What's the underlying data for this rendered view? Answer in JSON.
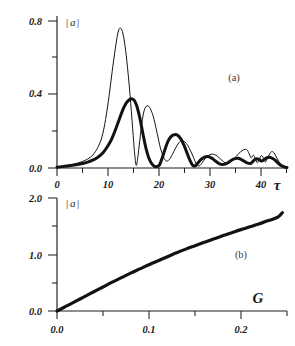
{
  "figure": {
    "background_color": "#ffffff",
    "ink_color": "#151515"
  },
  "chart_data": [
    {
      "type": "line",
      "panel_label": "(a)",
      "title": "",
      "xlabel": "τ",
      "ylabel": "|a|",
      "xlim": [
        0,
        45
      ],
      "ylim": [
        0.0,
        0.88
      ],
      "grid": false,
      "legend": "none",
      "xticks": [
        0,
        10,
        20,
        30,
        40
      ],
      "xticklabels": [
        "0",
        "10",
        "20",
        "30",
        "40"
      ],
      "xminorticks": [
        5,
        15,
        25,
        35,
        45
      ],
      "yticks": [
        0.0,
        0.4,
        0.8
      ],
      "yticklabels": [
        "0.0",
        "0.4",
        "0.8"
      ],
      "yminorticks": [
        0.2,
        0.6
      ],
      "series": [
        {
          "name": "thin-curve",
          "style": "thin",
          "linewidth": 1.0,
          "x": [
            0,
            1,
            2,
            3,
            4,
            5,
            6,
            7,
            8,
            8.8,
            9.5,
            10.2,
            10.8,
            11.4,
            11.9,
            12.3,
            12.8,
            13.3,
            13.8,
            14.3,
            14.8,
            15.2,
            15.5,
            15.8,
            16.2,
            16.7,
            17.2,
            17.8,
            18.4,
            19.0,
            19.6,
            20.2,
            20.8,
            21.4,
            22.0,
            22.6,
            23.2,
            23.8,
            24.4,
            25.0,
            25.6,
            26.2,
            26.8,
            27.3,
            27.8,
            28.4,
            29.0,
            29.6,
            30.2,
            30.8,
            31.4,
            32.0,
            32.6,
            33.2,
            33.8,
            34.4,
            35.0,
            35.6,
            36.2,
            36.8,
            37.2,
            37.6,
            38.0,
            38.4,
            38.8,
            39.2,
            39.6,
            40.0,
            40.4,
            40.8,
            41.2,
            41.6,
            42.0,
            42.4,
            42.8,
            43.2,
            43.6,
            44.0,
            44.4,
            45.0
          ],
          "y": [
            0.005,
            0.01,
            0.015,
            0.02,
            0.028,
            0.038,
            0.052,
            0.075,
            0.12,
            0.18,
            0.28,
            0.42,
            0.56,
            0.69,
            0.78,
            0.81,
            0.79,
            0.71,
            0.58,
            0.42,
            0.23,
            0.08,
            0.015,
            0.06,
            0.16,
            0.28,
            0.345,
            0.36,
            0.335,
            0.28,
            0.2,
            0.12,
            0.065,
            0.04,
            0.05,
            0.08,
            0.115,
            0.145,
            0.158,
            0.152,
            0.13,
            0.095,
            0.055,
            0.022,
            0.012,
            0.03,
            0.055,
            0.072,
            0.08,
            0.078,
            0.068,
            0.052,
            0.036,
            0.026,
            0.03,
            0.045,
            0.065,
            0.085,
            0.1,
            0.108,
            0.105,
            0.082,
            0.058,
            0.075,
            0.055,
            0.03,
            0.05,
            0.072,
            0.058,
            0.035,
            0.058,
            0.082,
            0.095,
            0.09,
            0.07,
            0.048,
            0.03,
            0.018,
            0.01,
            0.004
          ]
        },
        {
          "name": "thick-curve",
          "style": "thick",
          "linewidth": 3.0,
          "x": [
            0,
            1,
            2,
            3,
            4,
            5,
            6,
            7,
            8,
            9,
            10,
            10.8,
            11.6,
            12.4,
            13.0,
            13.6,
            14.2,
            14.7,
            15.1,
            15.6,
            16.2,
            16.8,
            17.4,
            18.0,
            18.6,
            19.2,
            19.7,
            20.1,
            20.6,
            21.2,
            21.8,
            22.4,
            23.0,
            23.6,
            24.2,
            24.8,
            25.4,
            26.0,
            26.5,
            27.0,
            27.6,
            28.2,
            28.8,
            29.4,
            30.0,
            30.6,
            31.2,
            31.8,
            32.4,
            33.0,
            33.6,
            34.2,
            34.8,
            35.4,
            36.0,
            36.6,
            37.2,
            37.8,
            38.2,
            38.6,
            39.0,
            39.5,
            40.0,
            40.5,
            41.0,
            41.6,
            42.2,
            42.8,
            43.2,
            43.6,
            44.0,
            44.5,
            45.0
          ],
          "y": [
            0.004,
            0.008,
            0.012,
            0.016,
            0.02,
            0.026,
            0.034,
            0.045,
            0.062,
            0.088,
            0.13,
            0.175,
            0.235,
            0.3,
            0.345,
            0.378,
            0.397,
            0.4,
            0.392,
            0.36,
            0.29,
            0.2,
            0.115,
            0.055,
            0.022,
            0.008,
            0.01,
            0.02,
            0.06,
            0.115,
            0.16,
            0.185,
            0.193,
            0.19,
            0.17,
            0.135,
            0.09,
            0.045,
            0.018,
            0.012,
            0.03,
            0.05,
            0.062,
            0.066,
            0.062,
            0.05,
            0.036,
            0.024,
            0.02,
            0.024,
            0.034,
            0.046,
            0.054,
            0.056,
            0.05,
            0.04,
            0.03,
            0.026,
            0.034,
            0.046,
            0.054,
            0.05,
            0.04,
            0.048,
            0.058,
            0.062,
            0.055,
            0.042,
            0.03,
            0.02,
            0.012,
            0.006,
            0.003
          ]
        }
      ]
    },
    {
      "type": "line",
      "panel_label": "(b)",
      "title": "",
      "xlabel": "G",
      "ylabel": "|a|",
      "xlim": [
        0.0,
        0.25
      ],
      "ylim": [
        0.0,
        2.0
      ],
      "grid": false,
      "legend": "none",
      "xticks": [
        0.0,
        0.1,
        0.2
      ],
      "xticklabels": [
        "0.0",
        "0.1",
        "0.2"
      ],
      "xminorticks": [
        0.05,
        0.15,
        0.25
      ],
      "yticks": [
        0.0,
        1.0,
        2.0
      ],
      "yticklabels": [
        "0.0",
        "1.0",
        "2.0"
      ],
      "yminorticks": [
        0.5,
        1.5
      ],
      "series": [
        {
          "name": "growth-curve",
          "style": "thick",
          "linewidth": 3.2,
          "x": [
            0.0,
            0.01,
            0.02,
            0.03,
            0.04,
            0.05,
            0.06,
            0.07,
            0.08,
            0.09,
            0.1,
            0.11,
            0.12,
            0.13,
            0.14,
            0.15,
            0.16,
            0.17,
            0.18,
            0.19,
            0.2,
            0.21,
            0.22,
            0.23,
            0.24,
            0.245
          ],
          "y": [
            0.0,
            0.085,
            0.17,
            0.255,
            0.34,
            0.425,
            0.51,
            0.59,
            0.67,
            0.745,
            0.82,
            0.89,
            0.96,
            1.03,
            1.095,
            1.155,
            1.215,
            1.275,
            1.33,
            1.385,
            1.44,
            1.49,
            1.545,
            1.6,
            1.66,
            1.74
          ]
        }
      ]
    }
  ],
  "panel_a": {
    "label": "(a)",
    "y_axis_title": "|a|",
    "y_axis_title_bar_left": "|",
    "y_axis_title_letter": "a",
    "y_axis_title_bar_right": "|",
    "x_axis_title": "τ",
    "yticklabels": [
      "0.8",
      "0.4",
      "0.0"
    ],
    "xticklabels": [
      "0",
      "10",
      "20",
      "30",
      "40"
    ]
  },
  "panel_b": {
    "label": "(b)",
    "y_axis_title": "|a|",
    "y_axis_title_bar_left": "|",
    "y_axis_title_letter": "a",
    "y_axis_title_bar_right": "|",
    "x_axis_title": "G",
    "yticklabels": [
      "2.0",
      "1.0",
      "0.0"
    ],
    "xticklabels": [
      "0.0",
      "0.1",
      "0.2"
    ]
  }
}
